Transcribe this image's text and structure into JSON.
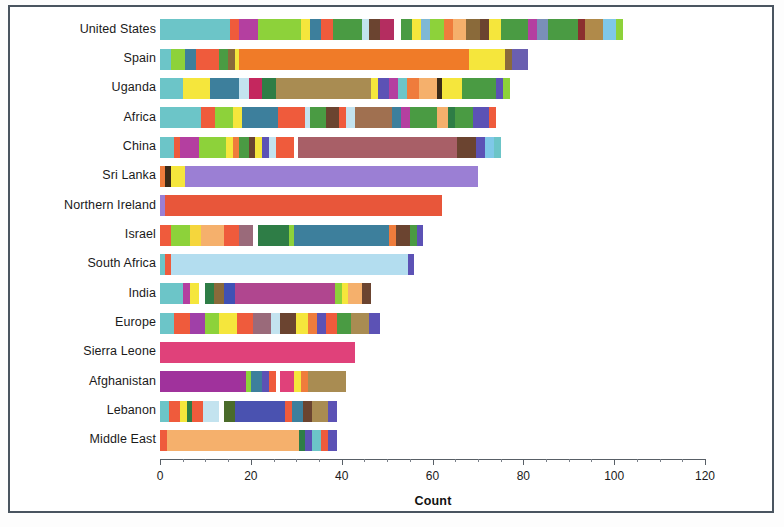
{
  "chart_data": {
    "type": "bar",
    "orientation": "horizontal",
    "stacked": true,
    "title": "",
    "subtitle": "",
    "xlabel": "Count",
    "ylabel": "",
    "xlim": [
      0,
      120
    ],
    "xticks": [
      0,
      20,
      40,
      60,
      80,
      100,
      120
    ],
    "xtick_labels": [
      "0",
      "20",
      "40",
      "60",
      "80",
      "100",
      "120"
    ],
    "grid": false,
    "legend": "none",
    "categories": [
      "United States",
      "Spain",
      "Uganda",
      "Africa",
      "China",
      "Sri Lanka",
      "Northern Ireland",
      "Israel",
      "South Africa",
      "India",
      "Europe",
      "Sierra Leone",
      "Afghanistan",
      "Lebanon",
      "Middle East"
    ],
    "totals": [
      111,
      81,
      79,
      76,
      75,
      70,
      62,
      58,
      56,
      49,
      47,
      43,
      41,
      41,
      39
    ],
    "bars": [
      {
        "category": "United States",
        "total": 111,
        "segments": [
          {
            "value": 15.5,
            "color": "#6cc5c8"
          },
          {
            "value": 2.0,
            "color": "#ef5b3c"
          },
          {
            "value": 4.0,
            "color": "#b43fa0"
          },
          {
            "value": 9.5,
            "color": "#8dd23a"
          },
          {
            "value": 2.0,
            "color": "#f5e63c"
          },
          {
            "value": 2.5,
            "color": "#3d7f9c"
          },
          {
            "value": 2.5,
            "color": "#ef5b3c"
          },
          {
            "value": 6.5,
            "color": "#4a9b43"
          },
          {
            "value": 1.5,
            "color": "#c3e3ef"
          },
          {
            "value": 2.5,
            "color": "#6b4430"
          },
          {
            "value": 3.0,
            "color": "#b42d60"
          },
          {
            "value": 1.5,
            "color": "#ffffff"
          },
          {
            "value": 2.5,
            "color": "#4a9b43"
          },
          {
            "value": 2.0,
            "color": "#f5e63c"
          },
          {
            "value": 2.0,
            "color": "#7fb8d4"
          },
          {
            "value": 3.0,
            "color": "#8dd23a"
          },
          {
            "value": 2.0,
            "color": "#ef7c3c"
          },
          {
            "value": 3.0,
            "color": "#f5b06c"
          },
          {
            "value": 3.0,
            "color": "#8a6a3a"
          },
          {
            "value": 2.0,
            "color": "#6b4430"
          },
          {
            "value": 2.5,
            "color": "#f5e63c"
          },
          {
            "value": 6.0,
            "color": "#4a9b43"
          },
          {
            "value": 2.0,
            "color": "#b43fa0"
          },
          {
            "value": 2.5,
            "color": "#7a8fb8"
          },
          {
            "value": 6.5,
            "color": "#4a9b43"
          },
          {
            "value": 1.5,
            "color": "#8b2f2f"
          },
          {
            "value": 4.0,
            "color": "#b08a4a"
          },
          {
            "value": 3.0,
            "color": "#7fc8e8"
          },
          {
            "value": 1.5,
            "color": "#8dd23a"
          }
        ]
      },
      {
        "category": "Spain",
        "total": 81,
        "segments": [
          {
            "value": 2.5,
            "color": "#6cc5c8"
          },
          {
            "value": 3.0,
            "color": "#8dd23a"
          },
          {
            "value": 2.5,
            "color": "#3d7f9c"
          },
          {
            "value": 5.0,
            "color": "#ef5b3c"
          },
          {
            "value": 2.0,
            "color": "#4a9b43"
          },
          {
            "value": 1.5,
            "color": "#8a6a3a"
          },
          {
            "value": 1.0,
            "color": "#f5e63c"
          },
          {
            "value": 50.5,
            "color": "#f07b28"
          },
          {
            "value": 8.0,
            "color": "#f5e63c"
          },
          {
            "value": 1.5,
            "color": "#8a6a3a"
          },
          {
            "value": 3.5,
            "color": "#6a5fb0"
          }
        ]
      },
      {
        "category": "Uganda",
        "total": 79,
        "segments": [
          {
            "value": 5.0,
            "color": "#6cc5c8"
          },
          {
            "value": 6.0,
            "color": "#f5e63c"
          },
          {
            "value": 6.5,
            "color": "#3d7f9c"
          },
          {
            "value": 2.0,
            "color": "#c3e3ef"
          },
          {
            "value": 3.0,
            "color": "#c4275e"
          },
          {
            "value": 3.0,
            "color": "#2e7d46"
          },
          {
            "value": 21.0,
            "color": "#a98c52"
          },
          {
            "value": 1.5,
            "color": "#f5e63c"
          },
          {
            "value": 2.5,
            "color": "#5c52b5"
          },
          {
            "value": 2.0,
            "color": "#b43fa0"
          },
          {
            "value": 2.0,
            "color": "#6cc5c8"
          },
          {
            "value": 2.5,
            "color": "#ef7c3c"
          },
          {
            "value": 4.0,
            "color": "#f5b06c"
          },
          {
            "value": 1.0,
            "color": "#3a2a18"
          },
          {
            "value": 4.5,
            "color": "#f5e63c"
          },
          {
            "value": 7.5,
            "color": "#4a9b43"
          },
          {
            "value": 1.5,
            "color": "#5c52b5"
          },
          {
            "value": 1.5,
            "color": "#8dd23a"
          },
          {
            "value": 2.0,
            "color": "#ffffff"
          }
        ]
      },
      {
        "category": "Africa",
        "total": 76,
        "segments": [
          {
            "value": 9.0,
            "color": "#6cc5c8"
          },
          {
            "value": 3.0,
            "color": "#ef5b3c"
          },
          {
            "value": 4.0,
            "color": "#8dd23a"
          },
          {
            "value": 2.0,
            "color": "#f5e63c"
          },
          {
            "value": 8.0,
            "color": "#3d7f9c"
          },
          {
            "value": 6.0,
            "color": "#ef5b3c"
          },
          {
            "value": 1.0,
            "color": "#c3e3ef"
          },
          {
            "value": 3.5,
            "color": "#4a9b43"
          },
          {
            "value": 3.0,
            "color": "#6b4430"
          },
          {
            "value": 1.5,
            "color": "#ef5b3c"
          },
          {
            "value": 2.0,
            "color": "#c3e3ef"
          },
          {
            "value": 8.0,
            "color": "#a07050"
          },
          {
            "value": 2.0,
            "color": "#3d7f9c"
          },
          {
            "value": 2.0,
            "color": "#b43fa0"
          },
          {
            "value": 6.0,
            "color": "#4a9b43"
          },
          {
            "value": 2.5,
            "color": "#f5b06c"
          },
          {
            "value": 1.5,
            "color": "#2e7d46"
          },
          {
            "value": 4.0,
            "color": "#4a9b43"
          },
          {
            "value": 3.5,
            "color": "#5c52b5"
          },
          {
            "value": 1.5,
            "color": "#ef5b3c"
          },
          {
            "value": 2.0,
            "color": "#ffffff"
          }
        ]
      },
      {
        "category": "China",
        "total": 75,
        "segments": [
          {
            "value": 3.0,
            "color": "#6cc5c8"
          },
          {
            "value": 1.5,
            "color": "#ef5b3c"
          },
          {
            "value": 4.0,
            "color": "#b43fa0"
          },
          {
            "value": 6.0,
            "color": "#8dd23a"
          },
          {
            "value": 1.5,
            "color": "#f5e63c"
          },
          {
            "value": 1.5,
            "color": "#ef7c3c"
          },
          {
            "value": 2.0,
            "color": "#4a9b43"
          },
          {
            "value": 1.5,
            "color": "#6b4430"
          },
          {
            "value": 1.5,
            "color": "#f5e63c"
          },
          {
            "value": 1.5,
            "color": "#5c52b5"
          },
          {
            "value": 1.5,
            "color": "#c3e3ef"
          },
          {
            "value": 4.0,
            "color": "#ef5b3c"
          },
          {
            "value": 1.0,
            "color": "#ffffff"
          },
          {
            "value": 35.0,
            "color": "#a85f67"
          },
          {
            "value": 4.0,
            "color": "#6b4430"
          },
          {
            "value": 2.0,
            "color": "#5c52b5"
          },
          {
            "value": 2.0,
            "color": "#7fc8e8"
          },
          {
            "value": 1.5,
            "color": "#6cc5c8"
          }
        ]
      },
      {
        "category": "Sri Lanka",
        "total": 70,
        "segments": [
          {
            "value": 1.0,
            "color": "#ef7c3c"
          },
          {
            "value": 1.5,
            "color": "#3a2a18"
          },
          {
            "value": 3.0,
            "color": "#f5e63c"
          },
          {
            "value": 64.5,
            "color": "#9b7fd4"
          }
        ]
      },
      {
        "category": "Northern Ireland",
        "total": 62,
        "segments": [
          {
            "value": 1.0,
            "color": "#9b7fd4"
          },
          {
            "value": 61.0,
            "color": "#e8563a"
          }
        ]
      },
      {
        "category": "Israel",
        "total": 58,
        "segments": [
          {
            "value": 2.5,
            "color": "#ef5b3c"
          },
          {
            "value": 4.0,
            "color": "#8dd23a"
          },
          {
            "value": 2.5,
            "color": "#f5d63c"
          },
          {
            "value": 5.0,
            "color": "#f5b06c"
          },
          {
            "value": 3.5,
            "color": "#ef5b3c"
          },
          {
            "value": 3.0,
            "color": "#9a6a7a"
          },
          {
            "value": 1.0,
            "color": "#ffffff"
          },
          {
            "value": 7.0,
            "color": "#2e7d46"
          },
          {
            "value": 1.0,
            "color": "#8dd23a"
          },
          {
            "value": 21.0,
            "color": "#3d7f9c"
          },
          {
            "value": 1.5,
            "color": "#ef7c3c"
          },
          {
            "value": 3.0,
            "color": "#6b4430"
          },
          {
            "value": 1.5,
            "color": "#4a9b43"
          },
          {
            "value": 1.5,
            "color": "#5c52b5"
          }
        ]
      },
      {
        "category": "South Africa",
        "total": 56,
        "segments": [
          {
            "value": 1.0,
            "color": "#6cc5c8"
          },
          {
            "value": 1.5,
            "color": "#ef5b3c"
          },
          {
            "value": 52.0,
            "color": "#b3ddef"
          },
          {
            "value": 1.5,
            "color": "#5c52b5"
          }
        ]
      },
      {
        "category": "India",
        "total": 49,
        "segments": [
          {
            "value": 5.0,
            "color": "#6cc5c8"
          },
          {
            "value": 1.5,
            "color": "#b43fa0"
          },
          {
            "value": 2.0,
            "color": "#f5e63c"
          },
          {
            "value": 1.5,
            "color": "#ffffff"
          },
          {
            "value": 2.0,
            "color": "#2e7d46"
          },
          {
            "value": 2.0,
            "color": "#8a6a3a"
          },
          {
            "value": 2.5,
            "color": "#3f51b5"
          },
          {
            "value": 22.0,
            "color": "#b0468f"
          },
          {
            "value": 1.5,
            "color": "#8dd23a"
          },
          {
            "value": 1.5,
            "color": "#f5e63c"
          },
          {
            "value": 3.0,
            "color": "#f5b06c"
          },
          {
            "value": 2.0,
            "color": "#6b4430"
          },
          {
            "value": 2.5,
            "color": "#ffffff"
          }
        ]
      },
      {
        "category": "Europe",
        "total": 47,
        "segments": [
          {
            "value": 3.0,
            "color": "#6cc5c8"
          },
          {
            "value": 3.5,
            "color": "#ef5b3c"
          },
          {
            "value": 3.5,
            "color": "#a040a8"
          },
          {
            "value": 3.0,
            "color": "#8dd23a"
          },
          {
            "value": 4.0,
            "color": "#f5e63c"
          },
          {
            "value": 3.5,
            "color": "#ef5b3c"
          },
          {
            "value": 4.0,
            "color": "#9a6a7a"
          },
          {
            "value": 2.0,
            "color": "#c3e3ef"
          },
          {
            "value": 3.5,
            "color": "#6b4430"
          },
          {
            "value": 2.5,
            "color": "#f5e63c"
          },
          {
            "value": 2.0,
            "color": "#ef7c3c"
          },
          {
            "value": 2.0,
            "color": "#5c52b5"
          },
          {
            "value": 2.5,
            "color": "#ef5b3c"
          },
          {
            "value": 3.0,
            "color": "#4a9b43"
          },
          {
            "value": 4.0,
            "color": "#a98c52"
          },
          {
            "value": 2.5,
            "color": "#5c52b5"
          }
        ]
      },
      {
        "category": "Sierra Leone",
        "total": 43,
        "segments": [
          {
            "value": 43.0,
            "color": "#e0417a"
          }
        ]
      },
      {
        "category": "Afghanistan",
        "total": 41,
        "segments": [
          {
            "value": 19.0,
            "color": "#a0329c"
          },
          {
            "value": 1.0,
            "color": "#8dd23a"
          },
          {
            "value": 2.5,
            "color": "#3d7f9c"
          },
          {
            "value": 1.5,
            "color": "#5c52b5"
          },
          {
            "value": 1.5,
            "color": "#ef5b3c"
          },
          {
            "value": 1.0,
            "color": "#ffffff"
          },
          {
            "value": 3.0,
            "color": "#e0417a"
          },
          {
            "value": 1.5,
            "color": "#f5e63c"
          },
          {
            "value": 1.5,
            "color": "#ef7c3c"
          },
          {
            "value": 8.5,
            "color": "#a98c52"
          }
        ]
      },
      {
        "category": "Lebanon",
        "total": 41,
        "segments": [
          {
            "value": 2.0,
            "color": "#6cc5c8"
          },
          {
            "value": 2.5,
            "color": "#ef5b3c"
          },
          {
            "value": 1.5,
            "color": "#f5e63c"
          },
          {
            "value": 1.0,
            "color": "#2e7d46"
          },
          {
            "value": 2.5,
            "color": "#ef5b3c"
          },
          {
            "value": 3.5,
            "color": "#c3e3ef"
          },
          {
            "value": 1.0,
            "color": "#ffffff"
          },
          {
            "value": 2.5,
            "color": "#4a6b2a"
          },
          {
            "value": 11.0,
            "color": "#4a52b0"
          },
          {
            "value": 1.5,
            "color": "#ef5b3c"
          },
          {
            "value": 2.5,
            "color": "#3d7f9c"
          },
          {
            "value": 2.0,
            "color": "#6b4430"
          },
          {
            "value": 3.5,
            "color": "#a98c52"
          },
          {
            "value": 2.0,
            "color": "#5c52b5"
          },
          {
            "value": 2.0,
            "color": "#ffffff"
          }
        ]
      },
      {
        "category": "Middle East",
        "total": 39,
        "segments": [
          {
            "value": 1.5,
            "color": "#ef5b3c"
          },
          {
            "value": 29.0,
            "color": "#f5b06c"
          },
          {
            "value": 1.5,
            "color": "#2e7d46"
          },
          {
            "value": 1.5,
            "color": "#5c52b5"
          },
          {
            "value": 2.0,
            "color": "#6cc5c8"
          },
          {
            "value": 1.5,
            "color": "#ef5b3c"
          },
          {
            "value": 2.0,
            "color": "#5c52b5"
          }
        ]
      }
    ]
  },
  "axis": {
    "x_title": "Count",
    "x_tick_labels": [
      "0",
      "20",
      "40",
      "60",
      "80",
      "100",
      "120"
    ],
    "y_tick_labels": [
      "United States",
      "Spain",
      "Uganda",
      "Africa",
      "China",
      "Sri Lanka",
      "Northern Ireland",
      "Israel",
      "South Africa",
      "India",
      "Europe",
      "Sierra Leone",
      "Afghanistan",
      "Lebanon",
      "Middle East"
    ]
  },
  "style": {
    "frame_color": "#4a5560",
    "axis_color": "#585f66",
    "background": "#ffffff"
  }
}
